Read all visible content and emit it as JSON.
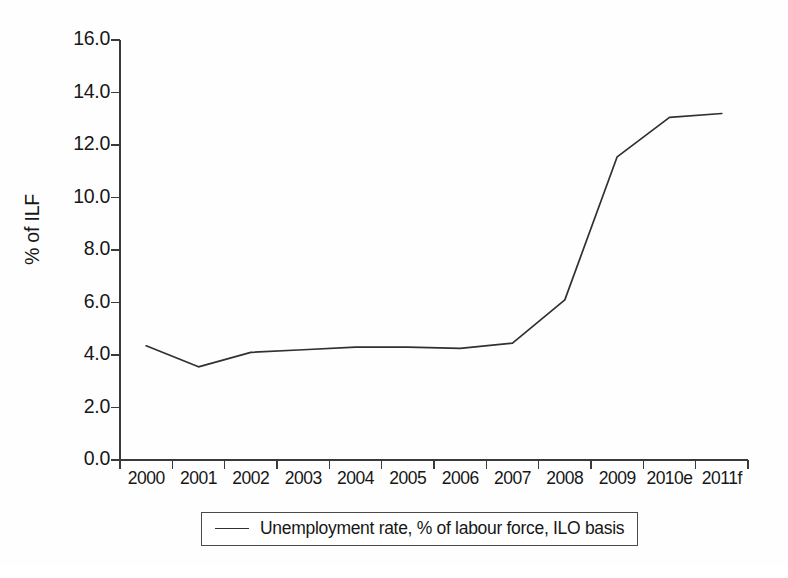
{
  "chart_data": {
    "type": "line",
    "title": "",
    "xlabel": "",
    "ylabel": "% of ILF",
    "ylim": [
      0.0,
      16.0
    ],
    "ytick_step": 2.0,
    "grid": false,
    "legend_position": "bottom-center",
    "categories": [
      "2000",
      "2001",
      "2002",
      "2003",
      "2004",
      "2005",
      "2006",
      "2007",
      "2008",
      "2009",
      "2010e",
      "2011f"
    ],
    "ytick_labels": [
      "0.0",
      "2.0",
      "4.0",
      "6.0",
      "8.0",
      "10.0",
      "12.0",
      "14.0",
      "16.0"
    ],
    "series": [
      {
        "name": "Unemployment rate, % of labour force, ILO basis",
        "color": "#303030",
        "values": [
          4.35,
          3.55,
          4.1,
          4.2,
          4.3,
          4.3,
          4.25,
          4.45,
          6.1,
          11.55,
          13.05,
          13.2
        ]
      }
    ]
  },
  "legend": {
    "entries": [
      {
        "label": "Unemployment rate, % of labour force, ILO basis",
        "color": "#303030"
      }
    ]
  },
  "axis": {
    "y_title": "% of ILF",
    "axis_color": "#3a3a3a"
  }
}
